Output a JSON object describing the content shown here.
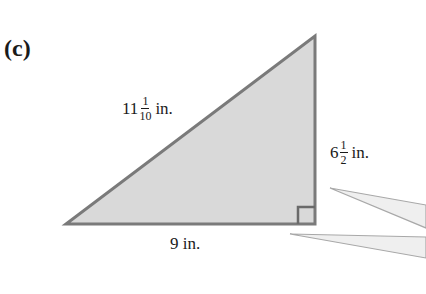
{
  "figure": {
    "part_label": "(c)",
    "shape": "right-triangle",
    "colors": {
      "fill": "#d9d9d9",
      "stroke": "#7a7a7a",
      "wedge_fill": "#efefef",
      "wedge_stroke": "#a8a8a8"
    },
    "sides": {
      "hypotenuse": {
        "whole": "11",
        "numerator": "1",
        "denominator": "10",
        "unit": "in."
      },
      "height": {
        "whole": "6",
        "numerator": "1",
        "denominator": "2",
        "unit": "in."
      },
      "base": {
        "text": "9 in."
      }
    },
    "right_angle_marker": true
  }
}
